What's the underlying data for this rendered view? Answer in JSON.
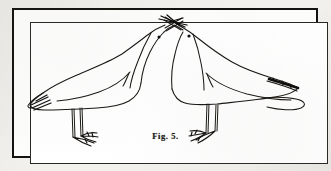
{
  "figure": {
    "caption": "Fig. 5.",
    "medium": "pen-and-ink line engraving",
    "frame": {
      "style": "double-rule rectangular border",
      "outer_color": "#14130f",
      "inner_color": "#2a2823"
    },
    "page_background": "#f2f1ed",
    "plate_background": "#ffffff",
    "ink_color": "#1a1814"
  },
  "subjects": [
    {
      "id": "left-bird",
      "label": "left seabird",
      "facing": "right",
      "body_direction": "tail to the left",
      "parts": [
        "head",
        "beak",
        "eye",
        "neck",
        "body",
        "wing",
        "wingtip",
        "tail",
        "leg",
        "webbed-foot"
      ],
      "dark_markings": [
        "wingtip"
      ],
      "legs": 2,
      "eye_count": 1
    },
    {
      "id": "right-bird",
      "label": "right seabird",
      "facing": "left",
      "body_direction": "tail to the right",
      "parts": [
        "head",
        "beak",
        "eye",
        "neck",
        "body",
        "wing",
        "wingtip",
        "tail",
        "leg",
        "webbed-foot"
      ],
      "dark_markings": [
        "wingtip",
        "tail"
      ],
      "legs": 2,
      "eye_count": 1
    }
  ],
  "interaction": {
    "label": "crossed beaks",
    "description": "the two birds touch bills at the apex, beaks crossing in an X"
  }
}
